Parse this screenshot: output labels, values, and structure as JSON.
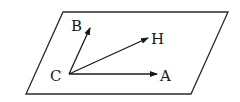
{
  "diagram": {
    "type": "vector-plane",
    "plane": {
      "name": "parallelogram-plane",
      "points": [
        [
          63,
          12
        ],
        [
          228,
          12
        ],
        [
          191,
          94
        ],
        [
          26,
          94
        ]
      ],
      "stroke": "#2a2a2a"
    },
    "origin": {
      "label": "C",
      "x": 69,
      "y": 74
    },
    "vectors": [
      {
        "name": "CB",
        "label": "B",
        "tip": [
          90,
          28
        ],
        "label_pos": [
          71,
          31
        ]
      },
      {
        "name": "CH",
        "label": "H",
        "tip": [
          148,
          38
        ],
        "label_pos": [
          151,
          44
        ]
      },
      {
        "name": "CA",
        "label": "A",
        "tip": [
          157,
          74
        ],
        "label_pos": [
          160,
          81
        ]
      }
    ],
    "labels": {
      "C": "C",
      "B": "B",
      "H": "H",
      "A": "A"
    },
    "line_color": "#1a1a1a"
  }
}
